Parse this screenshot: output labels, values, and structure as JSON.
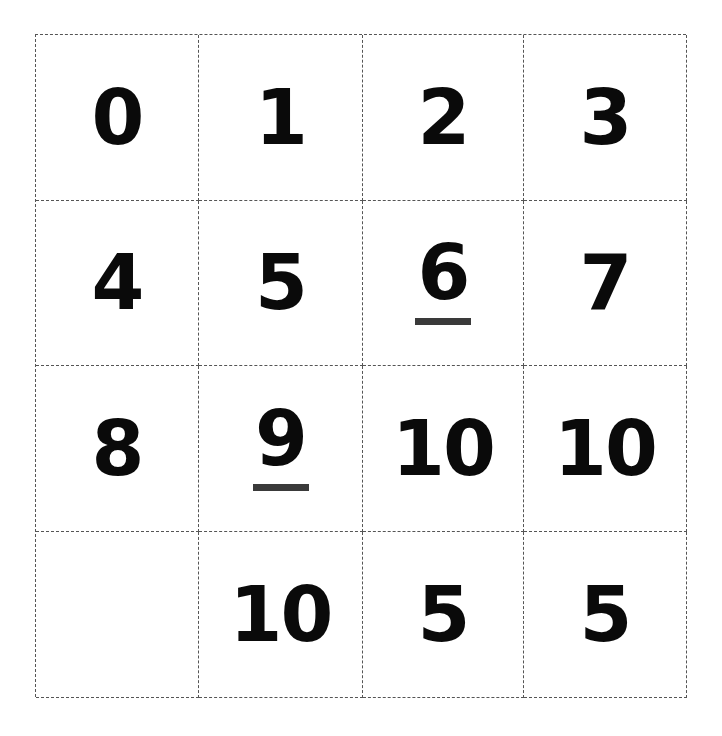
{
  "grid": {
    "rows": 4,
    "columns": 4,
    "cells": [
      {
        "value": "0",
        "underlined": false
      },
      {
        "value": "1",
        "underlined": false
      },
      {
        "value": "2",
        "underlined": false
      },
      {
        "value": "3",
        "underlined": false
      },
      {
        "value": "4",
        "underlined": false
      },
      {
        "value": "5",
        "underlined": false
      },
      {
        "value": "6",
        "underlined": true
      },
      {
        "value": "7",
        "underlined": false
      },
      {
        "value": "8",
        "underlined": false
      },
      {
        "value": "9",
        "underlined": true
      },
      {
        "value": "10",
        "underlined": false
      },
      {
        "value": "10",
        "underlined": false
      },
      {
        "value": "",
        "underlined": false
      },
      {
        "value": "10",
        "underlined": false
      },
      {
        "value": "5",
        "underlined": false
      },
      {
        "value": "5",
        "underlined": false
      }
    ]
  },
  "colors": {
    "text": "#0a0a0a",
    "underline": "#3a3a3a",
    "border": "#555555",
    "background": "#ffffff"
  }
}
